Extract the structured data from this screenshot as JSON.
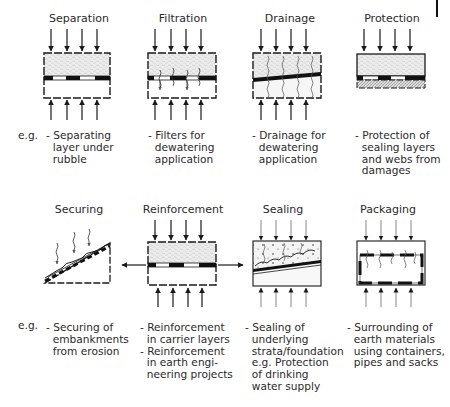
{
  "figure": {
    "eg_label": "e.g.",
    "row1": [
      {
        "id": "separation",
        "title": "Separation",
        "description": "- Separating\n  layer under\n  rubble"
      },
      {
        "id": "filtration",
        "title": "Filtration",
        "description": "- Filters for\n  dewatering\n  application"
      },
      {
        "id": "drainage",
        "title": "Drainage",
        "description": "- Drainage for\n  dewatering\n  application"
      },
      {
        "id": "protection",
        "title": "Protection",
        "description": "- Protection of\n  sealing layers\n  and webs from\n  damages"
      }
    ],
    "row2": [
      {
        "id": "securing",
        "title": "Securing",
        "description": "- Securing of\n  embankments\n  from erosion"
      },
      {
        "id": "reinforcement",
        "title": "Reinforcement",
        "description": "- Reinforcement\n  in carrier layers\n- Reinforcement\n  in earth engi-\n  neering projects"
      },
      {
        "id": "sealing",
        "title": "Sealing",
        "description": "- Sealing of\n  underlying\n  strata/foundation\n  e.g. Protection\n  of drinking\n  water supply"
      },
      {
        "id": "packaging",
        "title": "Packaging",
        "description": "- Surrounding of\n  earth materials\n  using containers,\n  pipes and sacks"
      }
    ]
  },
  "colors": {
    "ink": "#1a1a1a",
    "soil": "#e9e9e9",
    "background": "#ffffff"
  }
}
